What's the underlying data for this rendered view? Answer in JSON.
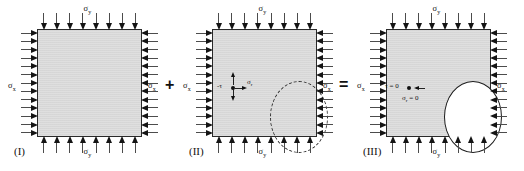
{
  "figure": {
    "background_color": "#ffffff",
    "block_fill_color": "#d9d9d9",
    "block_border_color": "#2a2a2a",
    "arrow_color": "#141414",
    "cavity_fill_color": "#ffffff"
  },
  "operators": {
    "plus": "+",
    "equals": "="
  },
  "panels": [
    {
      "caption": "(I)",
      "top_label": "σ",
      "top_sub": "y",
      "bottom_label": "σ",
      "bottom_sub": "y",
      "left_label": "σ",
      "left_sub": "x",
      "right_label": "σ",
      "right_sub": "x",
      "cavity": "none",
      "top_arrow_count": 8,
      "bottom_arrow_count": 8,
      "left_arrow_count": 13,
      "right_arrow_count": 13
    },
    {
      "caption": "(II)",
      "top_label": "σ",
      "top_sub": "y",
      "bottom_label": "σ",
      "bottom_sub": "y",
      "left_label": "σ",
      "left_sub": "x",
      "right_label": "σ",
      "right_sub": "x",
      "cavity": "dashed",
      "cavity_labels": {
        "shear": "-τ",
        "normal": "σ",
        "normal_sub": "r"
      },
      "top_arrow_count": 8,
      "bottom_arrow_count": 8,
      "left_arrow_count": 13,
      "right_arrow_count": 13
    },
    {
      "caption": "(III)",
      "top_label": "σ",
      "top_sub": "y",
      "bottom_label": "σ",
      "bottom_sub": "y",
      "left_label": "σ",
      "left_sub": "x",
      "right_label": "σ",
      "right_sub": "x",
      "cavity": "solid",
      "cavity_labels": {
        "shear": "τ = 0",
        "normal": "σ",
        "normal_sub": "r",
        "normal_value": " = 0"
      },
      "top_arrow_count": 8,
      "bottom_arrow_count": 8,
      "left_arrow_count": 13,
      "right_arrow_count": 13
    }
  ]
}
